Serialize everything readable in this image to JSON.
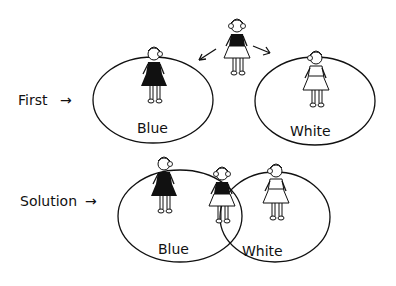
{
  "top_row": {
    "row_label": "First",
    "set_blue_label": "Blue",
    "set_white_label": "White"
  },
  "bottom_row": {
    "row_label": "Solution",
    "set_blue_label": "Blue",
    "set_white_label": "White"
  },
  "arrow_glyph": "→",
  "colors": {
    "ink": "#111111",
    "background": "#ffffff"
  }
}
